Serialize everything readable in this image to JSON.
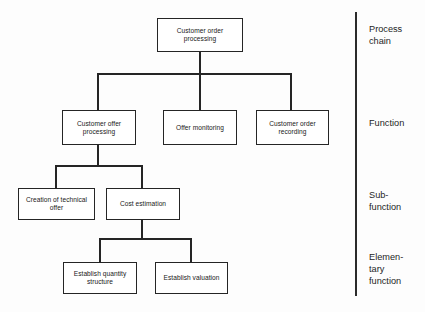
{
  "diagram": {
    "type": "hierarchy-tree",
    "colors": {
      "background": "#fdfdfd",
      "box_fill": "#ffffff",
      "line": "#252525",
      "text": "#202020",
      "divider": "#2b2b2b"
    },
    "nodes": [
      {
        "id": "root",
        "label": "Customer order\nprocessing",
        "level": "process-chain"
      },
      {
        "id": "offer-proc",
        "label": "Customer offer\nprocessing",
        "level": "function"
      },
      {
        "id": "offer-mon",
        "label": "Offer\nmonitoring",
        "level": "function"
      },
      {
        "id": "order-rec",
        "label": "Customer order\nrecording",
        "level": "function"
      },
      {
        "id": "tech-offer",
        "label": "Creation of\ntechnical offer",
        "level": "sub-function"
      },
      {
        "id": "cost-est",
        "label": "Cost estimation",
        "level": "sub-function"
      },
      {
        "id": "qty-struct",
        "label": "Establish quantity\nstructure",
        "level": "elementary-function"
      },
      {
        "id": "valuation",
        "label": "Establish\nvaluation",
        "level": "elementary-function"
      }
    ],
    "levels": [
      {
        "id": "process-chain",
        "label": "Process\nchain"
      },
      {
        "id": "function",
        "label": "Function"
      },
      {
        "id": "sub-function",
        "label": "Sub-\nfunction"
      },
      {
        "id": "elementary-function",
        "label": "Elemen-\ntary\nfunction"
      }
    ],
    "edges": [
      {
        "from": "root",
        "to": "offer-proc"
      },
      {
        "from": "root",
        "to": "offer-mon"
      },
      {
        "from": "root",
        "to": "order-rec"
      },
      {
        "from": "offer-proc",
        "to": "tech-offer"
      },
      {
        "from": "offer-proc",
        "to": "cost-est"
      },
      {
        "from": "cost-est",
        "to": "qty-struct"
      },
      {
        "from": "cost-est",
        "to": "valuation"
      }
    ]
  }
}
